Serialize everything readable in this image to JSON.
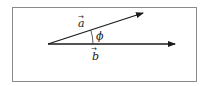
{
  "diagram": {
    "type": "vector-angle",
    "frame": {
      "x": 12,
      "y": 7,
      "width": 185,
      "height": 75,
      "border_color": "#8a8a8a"
    },
    "origin": {
      "x": 48,
      "y": 44
    },
    "vectors": [
      {
        "name": "a",
        "label": "a",
        "arrow": "→",
        "tip": {
          "x": 143,
          "y": 13
        },
        "color": "#1a1a1a"
      },
      {
        "name": "b",
        "label": "b",
        "arrow": "→",
        "tip": {
          "x": 175,
          "y": 44
        },
        "color": "#1a1a1a"
      }
    ],
    "angle": {
      "label": "ϕ",
      "between": [
        "a",
        "b"
      ]
    }
  }
}
